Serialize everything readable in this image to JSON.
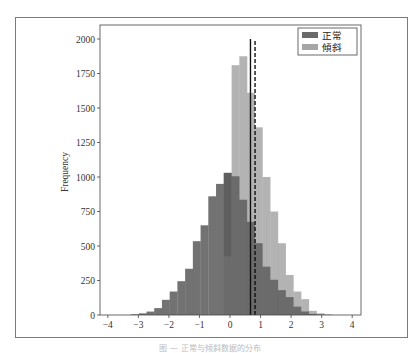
{
  "chart_data": {
    "type": "bar",
    "subtype": "histogram",
    "title": "",
    "xlabel": "",
    "ylabel": "Frequency",
    "xlim": [
      -4.2,
      4.3
    ],
    "ylim": [
      0,
      2100
    ],
    "xticks": [
      -4,
      -3,
      -2,
      -1,
      0,
      1,
      2,
      3,
      4
    ],
    "yticks": [
      0,
      250,
      500,
      750,
      1000,
      1250,
      1500,
      1750,
      2000
    ],
    "grid": false,
    "legend_position": "upper right",
    "bin_width": 0.253,
    "series": [
      {
        "name": "正常",
        "color": "#6a6a6a",
        "bin_start": -3.24,
        "values": [
          5,
          12,
          25,
          50,
          110,
          170,
          245,
          335,
          535,
          650,
          860,
          950,
          1030,
          1005,
          835,
          675,
          520,
          350,
          255,
          180,
          130,
          60,
          25,
          8,
          3
        ]
      },
      {
        "name": "傾斜",
        "color": "#a6a6a6",
        "bin_start": -0.2,
        "values": [
          425,
          1810,
          1875,
          1610,
          1360,
          1000,
          750,
          520,
          290,
          170,
          115,
          30,
          12,
          5
        ]
      }
    ],
    "vlines": [
      {
        "name": "mean-normal",
        "x": 0.67,
        "style": "solid",
        "color": "#111111",
        "ymax": 2000
      },
      {
        "name": "mean-skewed",
        "x": 0.82,
        "style": "dashed",
        "color": "#111111",
        "ymax": 2000
      }
    ]
  },
  "legend": {
    "items": [
      {
        "label": "正常",
        "color": "#6a6a6a"
      },
      {
        "label": "傾斜",
        "color": "#a6a6a6"
      }
    ]
  },
  "caption": "图 — 正常与倾斜数据的分布"
}
